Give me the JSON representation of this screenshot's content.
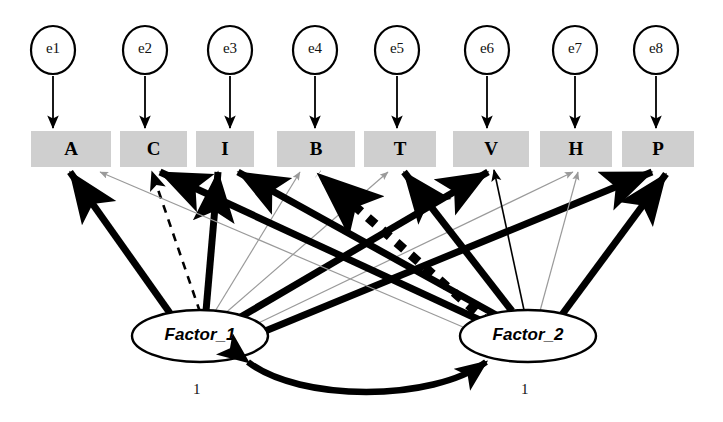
{
  "diagram": {
    "type": "sem-path-diagram",
    "colors": {
      "box_fill": "#cfcfcf",
      "stroke_strong": "#000000",
      "stroke_faint": "#9a9a9a",
      "background": "#ffffff"
    },
    "errors": [
      {
        "id": "e1",
        "label": "e1",
        "cx": 53,
        "cy": 50,
        "rx": 22,
        "ry": 24
      },
      {
        "id": "e2",
        "label": "e2",
        "cx": 145,
        "cy": 50,
        "rx": 22,
        "ry": 24
      },
      {
        "id": "e3",
        "label": "e3",
        "cx": 230,
        "cy": 50,
        "rx": 22,
        "ry": 24
      },
      {
        "id": "e4",
        "label": "e4",
        "cx": 315,
        "cy": 50,
        "rx": 22,
        "ry": 24
      },
      {
        "id": "e5",
        "label": "e5",
        "cx": 397,
        "cy": 50,
        "rx": 22,
        "ry": 24
      },
      {
        "id": "e6",
        "label": "e6",
        "cx": 487,
        "cy": 50,
        "rx": 22,
        "ry": 24
      },
      {
        "id": "e7",
        "label": "e7",
        "cx": 575,
        "cy": 50,
        "rx": 22,
        "ry": 24
      },
      {
        "id": "e8",
        "label": "e8",
        "cx": 656,
        "cy": 50,
        "rx": 22,
        "ry": 24
      }
    ],
    "observed": [
      {
        "id": "A",
        "label": "A",
        "x": 31,
        "y": 131,
        "w": 80,
        "h": 36
      },
      {
        "id": "C",
        "label": "C",
        "x": 120,
        "y": 131,
        "w": 67,
        "h": 36
      },
      {
        "id": "I",
        "label": "I",
        "x": 196,
        "y": 131,
        "w": 58,
        "h": 36
      },
      {
        "id": "B",
        "label": "B",
        "x": 277,
        "y": 131,
        "w": 78,
        "h": 36
      },
      {
        "id": "T",
        "label": "T",
        "x": 364,
        "y": 131,
        "w": 72,
        "h": 36
      },
      {
        "id": "V",
        "label": "V",
        "x": 453,
        "y": 131,
        "w": 76,
        "h": 36
      },
      {
        "id": "H",
        "label": "H",
        "x": 540,
        "y": 131,
        "w": 72,
        "h": 36
      },
      {
        "id": "P",
        "label": "P",
        "x": 622,
        "y": 131,
        "w": 72,
        "h": 36
      }
    ],
    "factors": [
      {
        "id": "F1",
        "label": "Factor_1",
        "cx": 200,
        "cy": 336,
        "rx": 68,
        "ry": 26,
        "variance_label": "1",
        "variance_x": 193,
        "variance_y": 381
      },
      {
        "id": "F2",
        "label": "Factor_2",
        "cx": 528,
        "cy": 336,
        "rx": 68,
        "ry": 26,
        "variance_label": "1",
        "variance_x": 521,
        "variance_y": 381
      }
    ],
    "error_paths": [
      {
        "from": "e1",
        "to": "A",
        "x": 53,
        "y1": 76,
        "y2": 128
      },
      {
        "from": "e2",
        "to": "C",
        "x": 145,
        "y1": 76,
        "y2": 128
      },
      {
        "from": "e3",
        "to": "I",
        "x": 230,
        "y1": 76,
        "y2": 128
      },
      {
        "from": "e4",
        "to": "B",
        "x": 315,
        "y1": 76,
        "y2": 128
      },
      {
        "from": "e5",
        "to": "T",
        "x": 397,
        "y1": 76,
        "y2": 128
      },
      {
        "from": "e6",
        "to": "V",
        "x": 487,
        "y1": 76,
        "y2": 128
      },
      {
        "from": "e7",
        "to": "H",
        "x": 575,
        "y1": 76,
        "y2": 128
      },
      {
        "from": "e8",
        "to": "P",
        "x": 656,
        "y1": 76,
        "y2": 128
      }
    ],
    "loadings": [
      {
        "from": "Factor_1",
        "to": "A",
        "style": "thick-solid",
        "x1": 172,
        "y1": 316,
        "x2": 70,
        "y2": 172
      },
      {
        "from": "Factor_1",
        "to": "C",
        "style": "thin-dashed",
        "x1": 200,
        "y1": 312,
        "x2": 152,
        "y2": 172
      },
      {
        "from": "Factor_1",
        "to": "I",
        "style": "thick-solid",
        "x1": 206,
        "y1": 311,
        "x2": 218,
        "y2": 172
      },
      {
        "from": "Factor_1",
        "to": "B",
        "style": "faint-solid",
        "x1": 214,
        "y1": 313,
        "x2": 300,
        "y2": 172
      },
      {
        "from": "Factor_1",
        "to": "T",
        "style": "faint-solid",
        "x1": 222,
        "y1": 316,
        "x2": 388,
        "y2": 172
      },
      {
        "from": "Factor_1",
        "to": "V",
        "style": "thick-solid",
        "x1": 232,
        "y1": 322,
        "x2": 488,
        "y2": 172
      },
      {
        "from": "Factor_1",
        "to": "H",
        "style": "faint-solid",
        "x1": 244,
        "y1": 330,
        "x2": 573,
        "y2": 172
      },
      {
        "from": "Factor_1",
        "to": "P",
        "style": "thick-solid",
        "x1": 258,
        "y1": 334,
        "x2": 652,
        "y2": 172
      },
      {
        "from": "Factor_2",
        "to": "A",
        "style": "faint-solid",
        "x1": 470,
        "y1": 330,
        "x2": 100,
        "y2": 172
      },
      {
        "from": "Factor_2",
        "to": "C",
        "style": "thick-solid",
        "x1": 484,
        "y1": 322,
        "x2": 160,
        "y2": 172
      },
      {
        "from": "Factor_2",
        "to": "I",
        "style": "thick-solid",
        "x1": 498,
        "y1": 316,
        "x2": 238,
        "y2": 172
      },
      {
        "from": "Factor_2",
        "to": "B",
        "style": "thick-dotted",
        "x1": 490,
        "y1": 324,
        "x2": 318,
        "y2": 174
      },
      {
        "from": "Factor_2",
        "to": "T",
        "style": "thick-solid",
        "x1": 512,
        "y1": 311,
        "x2": 404,
        "y2": 172
      },
      {
        "from": "Factor_2",
        "to": "V",
        "style": "thin-solid",
        "x1": 524,
        "y1": 310,
        "x2": 494,
        "y2": 170
      },
      {
        "from": "Factor_2",
        "to": "H",
        "style": "faint-solid",
        "x1": 540,
        "y1": 311,
        "x2": 578,
        "y2": 172
      },
      {
        "from": "Factor_2",
        "to": "P",
        "style": "thick-solid",
        "x1": 558,
        "y1": 320,
        "x2": 666,
        "y2": 174
      }
    ],
    "covariance": {
      "from": "Factor_1",
      "to": "Factor_2",
      "style": "thick-curved-double-headed",
      "path": "M 248 362 C 300 402, 432 402, 486 362"
    }
  }
}
